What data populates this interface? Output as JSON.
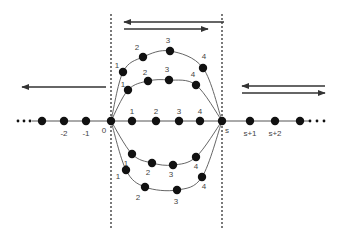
{
  "colors": {
    "background": "#ffffff",
    "ink": "#111111",
    "line": "#555555",
    "label": "#444444"
  },
  "axis": {
    "y": 121,
    "x_start": 32,
    "x_end": 310,
    "ellipsis_left": [
      18,
      24,
      30
    ],
    "ellipsis_right": [
      310,
      317,
      324
    ],
    "nodes": [
      {
        "x": 42,
        "label": ""
      },
      {
        "x": 64,
        "label": "-2"
      },
      {
        "x": 86,
        "label": "-1"
      },
      {
        "x": 111,
        "label": "0"
      },
      {
        "x": 132,
        "label": "1"
      },
      {
        "x": 156,
        "label": "2"
      },
      {
        "x": 179,
        "label": "3"
      },
      {
        "x": 200,
        "label": "4"
      },
      {
        "x": 222,
        "label": "s"
      },
      {
        "x": 250,
        "label": "s+1"
      },
      {
        "x": 275,
        "label": "s+2"
      },
      {
        "x": 300,
        "label": ""
      }
    ]
  },
  "dashed_lines": [
    {
      "x": 111,
      "y1": 14,
      "y2": 230
    },
    {
      "x": 222,
      "y1": 14,
      "y2": 230
    }
  ],
  "arrows": [
    {
      "name": "top-left-arrow",
      "x1": 224,
      "y1": 22,
      "x2": 124,
      "y2": 22
    },
    {
      "name": "top-right-arrow",
      "x1": 124,
      "y1": 29,
      "x2": 208,
      "y2": 29
    },
    {
      "name": "far-left-arrow",
      "x1": 106,
      "y1": 87,
      "x2": 22,
      "y2": 87
    },
    {
      "name": "right-left-arrow",
      "x1": 325,
      "y1": 86,
      "x2": 242,
      "y2": 86
    },
    {
      "name": "right-right-arrow",
      "x1": 242,
      "y1": 93,
      "x2": 325,
      "y2": 93
    }
  ],
  "paths": [
    {
      "name": "outer-top-path",
      "points": [
        {
          "x": 123,
          "y": 72,
          "label": "1",
          "lx": 117,
          "ly": 68
        },
        {
          "x": 143,
          "y": 57,
          "label": "2",
          "lx": 137,
          "ly": 50
        },
        {
          "x": 170,
          "y": 51,
          "label": "3",
          "lx": 168,
          "ly": 43
        },
        {
          "x": 203,
          "y": 68,
          "label": "4",
          "lx": 204,
          "ly": 59
        }
      ]
    },
    {
      "name": "inner-top-path",
      "points": [
        {
          "x": 128,
          "y": 90,
          "label": "1",
          "lx": 123,
          "ly": 87
        },
        {
          "x": 148,
          "y": 81,
          "label": "2",
          "lx": 145,
          "ly": 75
        },
        {
          "x": 169,
          "y": 80,
          "label": "3",
          "lx": 167,
          "ly": 72
        },
        {
          "x": 196,
          "y": 85,
          "label": "4",
          "lx": 193,
          "ly": 77
        }
      ]
    },
    {
      "name": "inner-bottom-path",
      "points": [
        {
          "x": 132,
          "y": 154,
          "label": "1",
          "lx": 126,
          "ly": 166
        },
        {
          "x": 152,
          "y": 163,
          "label": "2",
          "lx": 148,
          "ly": 175
        },
        {
          "x": 173,
          "y": 165,
          "label": "3",
          "lx": 171,
          "ly": 177
        },
        {
          "x": 196,
          "y": 157,
          "label": "4",
          "lx": 196,
          "ly": 169
        }
      ]
    },
    {
      "name": "outer-bottom-path",
      "points": [
        {
          "x": 126,
          "y": 170,
          "label": "1",
          "lx": 118,
          "ly": 179
        },
        {
          "x": 145,
          "y": 187,
          "label": "2",
          "lx": 138,
          "ly": 200
        },
        {
          "x": 177,
          "y": 190,
          "label": "3",
          "lx": 176,
          "ly": 204
        },
        {
          "x": 202,
          "y": 177,
          "label": "4",
          "lx": 204,
          "ly": 189
        }
      ]
    }
  ],
  "axis_labels": [
    {
      "text": "-2",
      "x": 64,
      "y": 136
    },
    {
      "text": "-1",
      "x": 86,
      "y": 136
    },
    {
      "text": "0",
      "x": 104,
      "y": 133
    },
    {
      "text": "1",
      "x": 132,
      "y": 114
    },
    {
      "text": "2",
      "x": 156,
      "y": 114
    },
    {
      "text": "3",
      "x": 179,
      "y": 114
    },
    {
      "text": "4",
      "x": 200,
      "y": 114
    },
    {
      "text": "s",
      "x": 227,
      "y": 133
    },
    {
      "text": "s+1",
      "x": 250,
      "y": 136
    },
    {
      "text": "s+2",
      "x": 275,
      "y": 136
    }
  ]
}
